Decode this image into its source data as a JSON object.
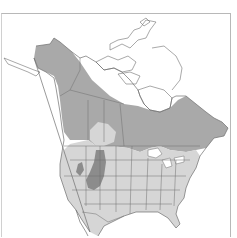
{
  "map": {
    "type": "species-range-map",
    "region": "North America",
    "colors": {
      "background": "#ffffff",
      "land_outside_range": "#ffffff",
      "summer_range": "#a9a9a9",
      "year_round_range": "#d6d6d6",
      "core_range": "#8c8c8c",
      "border_lines": "#6e6e6e",
      "frame": "#b8b8b8"
    },
    "legend": []
  }
}
